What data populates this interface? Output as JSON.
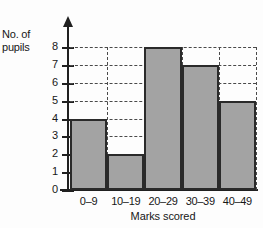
{
  "chart_data": {
    "type": "bar",
    "title": "",
    "subtitle": "",
    "xlabel": "Marks scored",
    "ylabel": "No. of pupils",
    "ylabel_lines": [
      "No. of",
      "pupils"
    ],
    "categories": [
      "0–9",
      "10–19",
      "20–29",
      "30–39",
      "40–49"
    ],
    "values": [
      4,
      2,
      8,
      7,
      5
    ],
    "yticks": [
      0,
      1,
      2,
      3,
      4,
      5,
      6,
      7,
      8
    ],
    "ytick_labels": [
      "0",
      "1",
      "2",
      "3",
      "4",
      "5",
      "6",
      "7",
      "8"
    ],
    "ylim": [
      0,
      8
    ],
    "grid": "dashed-both",
    "legend": "none",
    "bar_fill_color": "#a3a3a3",
    "bar_edge_color": "#2a2a2a",
    "grid_color": "#4a4a4a",
    "axis_color": "#202020",
    "background_color": "#fdfdfd",
    "y_axis_arrow": true,
    "annotations": []
  }
}
